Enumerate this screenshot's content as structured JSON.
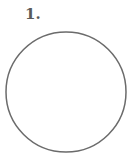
{
  "figure": {
    "label": "1.",
    "shape": "circle",
    "stroke_color": "#6b6b6b",
    "fill_color": "#ffffff"
  }
}
